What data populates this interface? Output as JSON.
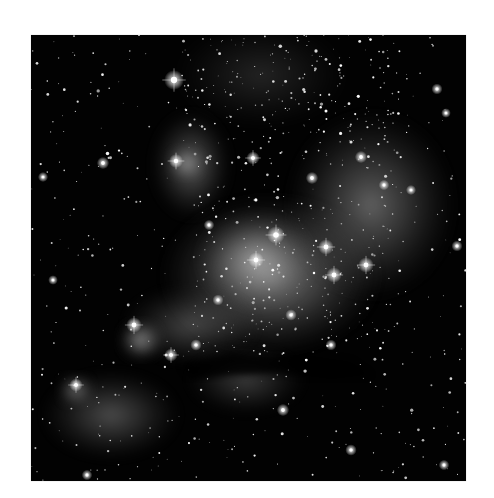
{
  "image": {
    "subject": "star-forming nebula with open star clusters (grayscale astronomical photograph)",
    "background_color": "#ffffff",
    "sky_color": "#020202",
    "frame": {
      "x": 31,
      "y": 35,
      "width": 435,
      "height": 446
    },
    "nebula_regions": [
      {
        "name": "central-cluster-glow",
        "cx": 240,
        "cy": 240,
        "rx": 110,
        "ry": 80,
        "opacity": 0.55
      },
      {
        "name": "core-bright",
        "cx": 225,
        "cy": 225,
        "rx": 60,
        "ry": 50,
        "opacity": 0.5
      },
      {
        "name": "right-arc-shell",
        "cx": 340,
        "cy": 170,
        "rx": 85,
        "ry": 95,
        "opacity": 0.42
      },
      {
        "name": "upper-left-knot",
        "cx": 160,
        "cy": 130,
        "rx": 40,
        "ry": 55,
        "opacity": 0.4
      },
      {
        "name": "upper-left-knot-core",
        "cx": 155,
        "cy": 128,
        "rx": 18,
        "ry": 16,
        "opacity": 0.55
      },
      {
        "name": "left-lobe-bright",
        "cx": 110,
        "cy": 305,
        "rx": 22,
        "ry": 20,
        "opacity": 0.65
      },
      {
        "name": "lower-left-tail",
        "cx": 80,
        "cy": 380,
        "rx": 70,
        "ry": 45,
        "opacity": 0.33
      },
      {
        "name": "lower-left-knot",
        "cx": 45,
        "cy": 355,
        "rx": 18,
        "ry": 16,
        "opacity": 0.5
      },
      {
        "name": "lower-middle-wisp",
        "cx": 215,
        "cy": 345,
        "rx": 60,
        "ry": 35,
        "opacity": 0.25
      },
      {
        "name": "mid-left-bridge",
        "cx": 160,
        "cy": 290,
        "rx": 70,
        "ry": 40,
        "opacity": 0.3
      },
      {
        "name": "top-cluster-haze",
        "cx": 230,
        "cy": 40,
        "rx": 90,
        "ry": 55,
        "opacity": 0.15
      }
    ],
    "dust_lanes": [
      {
        "name": "dark-dust-lane",
        "points": "150,330 200,318 240,322 280,320 320,326 340,340 300,345 250,338 200,340 160,345"
      }
    ],
    "bright_stars": [
      {
        "x": 143,
        "y": 45,
        "r": 4.5
      },
      {
        "x": 245,
        "y": 200,
        "r": 4
      },
      {
        "x": 295,
        "y": 212,
        "r": 3.5
      },
      {
        "x": 225,
        "y": 225,
        "r": 3.5
      },
      {
        "x": 335,
        "y": 230,
        "r": 3.5
      },
      {
        "x": 303,
        "y": 240,
        "r": 3.5
      },
      {
        "x": 222,
        "y": 123,
        "r": 3
      },
      {
        "x": 145,
        "y": 126,
        "r": 3.2
      },
      {
        "x": 103,
        "y": 290,
        "r": 3.5
      },
      {
        "x": 140,
        "y": 320,
        "r": 3
      },
      {
        "x": 45,
        "y": 350,
        "r": 3
      },
      {
        "x": 72,
        "y": 128,
        "r": 2.8
      },
      {
        "x": 281,
        "y": 143,
        "r": 2.8
      },
      {
        "x": 330,
        "y": 122,
        "r": 2.8
      },
      {
        "x": 406,
        "y": 54,
        "r": 2.5
      },
      {
        "x": 426,
        "y": 211,
        "r": 2.5
      },
      {
        "x": 252,
        "y": 375,
        "r": 2.8
      },
      {
        "x": 320,
        "y": 415,
        "r": 2.6
      },
      {
        "x": 413,
        "y": 430,
        "r": 2.4
      },
      {
        "x": 56,
        "y": 440,
        "r": 2.4
      },
      {
        "x": 300,
        "y": 310,
        "r": 2.5
      },
      {
        "x": 187,
        "y": 265,
        "r": 2.5
      },
      {
        "x": 260,
        "y": 280,
        "r": 2.6
      },
      {
        "x": 353,
        "y": 150,
        "r": 2.4
      },
      {
        "x": 178,
        "y": 190,
        "r": 2.4
      },
      {
        "x": 380,
        "y": 155,
        "r": 2.3
      },
      {
        "x": 12,
        "y": 142,
        "r": 2.3
      },
      {
        "x": 415,
        "y": 78,
        "r": 2.2
      },
      {
        "x": 22,
        "y": 245,
        "r": 2.2
      },
      {
        "x": 165,
        "y": 310,
        "r": 2.6
      }
    ],
    "faint_star_count": 900,
    "faint_star_seed": 7
  }
}
